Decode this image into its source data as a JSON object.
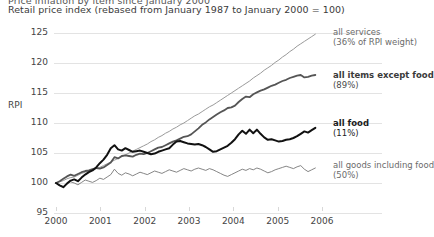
{
  "header": {
    "clipped_title": "Price inflation by item since January 2000",
    "subtitle": "Retail price index (rebased from January 1987 to January 2000 = 100)"
  },
  "chart_data": {
    "type": "line",
    "title": "Retail price index (rebased from January 1987 to January 2000 = 100)",
    "xlabel": "",
    "ylabel": "RPI",
    "ylim": [
      95,
      125
    ],
    "xlim": [
      2000,
      2006
    ],
    "grid": true,
    "legend_position": "right-inline",
    "yticks": [
      "125",
      "120",
      "115",
      "110",
      "105",
      "100",
      "95"
    ],
    "ytick_values": [
      125,
      120,
      115,
      110,
      105,
      100,
      95
    ],
    "xticks": [
      "2000",
      "2001",
      "2002",
      "2003",
      "2004",
      "2005",
      "2006"
    ],
    "xtick_values": [
      2000,
      2001,
      2002,
      2003,
      2004,
      2005,
      2006
    ],
    "series": [
      {
        "name": "all services",
        "sublabel": "(36% of RPI weight)",
        "color": "#9a9a9a",
        "width": 1.0,
        "values": [
          100.0,
          100.2,
          100.4,
          100.7,
          100.9,
          101.0,
          101.3,
          101.6,
          101.8,
          102.0,
          102.2,
          102.4,
          102.6,
          102.9,
          103.2,
          103.5,
          103.8,
          104.1,
          104.4,
          104.7,
          105.0,
          105.3,
          105.6,
          105.9,
          106.2,
          106.5,
          106.9,
          107.2,
          107.6,
          107.9,
          108.3,
          108.6,
          109.0,
          109.3,
          109.7,
          110.0,
          110.4,
          110.8,
          111.2,
          111.5,
          111.9,
          112.3,
          112.7,
          113.0,
          113.4,
          113.8,
          114.2,
          114.6,
          115.0,
          115.4,
          115.8,
          116.2,
          116.6,
          117.0,
          117.5,
          117.9,
          118.3,
          118.8,
          119.2,
          119.6,
          120.1,
          120.5,
          121.0,
          121.4,
          121.9,
          122.3,
          122.8,
          123.2,
          123.6,
          124.0,
          124.4,
          124.8
        ]
      },
      {
        "name": "all items except food",
        "sublabel": "(89%)",
        "color": "#555555",
        "width": 1.8,
        "values": [
          100.0,
          100.3,
          100.7,
          101.1,
          101.4,
          101.2,
          101.5,
          101.8,
          102.0,
          102.1,
          102.3,
          102.5,
          102.4,
          102.6,
          103.0,
          103.4,
          104.3,
          104.1,
          104.5,
          104.6,
          104.5,
          104.4,
          104.7,
          104.9,
          104.8,
          105.0,
          105.3,
          105.6,
          105.9,
          106.0,
          106.3,
          106.6,
          106.9,
          107.1,
          107.4,
          107.7,
          107.8,
          108.1,
          108.6,
          109.1,
          109.7,
          110.1,
          110.6,
          111.0,
          111.4,
          111.8,
          112.1,
          112.5,
          112.6,
          112.9,
          113.5,
          114.0,
          114.4,
          114.3,
          114.8,
          115.1,
          115.4,
          115.6,
          115.9,
          116.2,
          116.4,
          116.7,
          117.0,
          117.2,
          117.5,
          117.7,
          117.9,
          118.0,
          117.6,
          117.7,
          117.9,
          118.0
        ]
      },
      {
        "name": "all food",
        "sublabel": "(11%)",
        "color": "#111111",
        "width": 2.0,
        "values": [
          100.0,
          99.6,
          99.3,
          99.9,
          100.4,
          100.6,
          100.3,
          100.9,
          101.4,
          101.8,
          102.1,
          102.6,
          103.3,
          103.9,
          104.7,
          105.8,
          106.3,
          105.6,
          105.4,
          105.8,
          105.5,
          105.2,
          105.3,
          105.4,
          105.2,
          105.0,
          104.8,
          104.9,
          105.2,
          105.4,
          105.6,
          105.8,
          106.4,
          106.9,
          107.0,
          106.8,
          106.6,
          106.5,
          106.4,
          106.5,
          106.3,
          106.0,
          105.6,
          105.2,
          105.3,
          105.6,
          105.9,
          106.2,
          106.7,
          107.3,
          108.1,
          108.7,
          108.2,
          108.9,
          108.3,
          108.9,
          108.2,
          107.6,
          107.2,
          107.3,
          107.1,
          106.9,
          107.0,
          107.2,
          107.3,
          107.5,
          107.8,
          108.2,
          108.6,
          108.4,
          108.8,
          109.2
        ]
      },
      {
        "name": "all goods including food",
        "sublabel": "(50%)",
        "color": "#777777",
        "width": 0.9,
        "values": [
          100.0,
          99.6,
          99.4,
          99.8,
          100.2,
          100.0,
          99.7,
          100.1,
          100.5,
          100.3,
          100.1,
          100.4,
          100.8,
          100.6,
          101.0,
          101.4,
          102.3,
          101.6,
          101.3,
          101.7,
          101.5,
          101.2,
          101.5,
          101.8,
          101.6,
          101.4,
          101.7,
          102.0,
          101.8,
          101.6,
          101.9,
          102.2,
          102.0,
          101.8,
          102.1,
          102.4,
          102.2,
          102.0,
          102.3,
          102.5,
          102.3,
          102.1,
          102.4,
          102.2,
          101.9,
          101.6,
          101.3,
          101.1,
          101.4,
          101.7,
          102.0,
          102.3,
          102.1,
          102.4,
          102.2,
          102.5,
          102.3,
          102.0,
          101.7,
          101.9,
          102.2,
          102.4,
          102.6,
          102.8,
          102.6,
          102.4,
          102.7,
          102.9,
          102.3,
          101.9,
          102.2,
          102.5
        ]
      }
    ]
  },
  "labels": {
    "series1_line1": "all services",
    "series1_line2": "(36% of RPI weight)",
    "series2_line1": "all items except food",
    "series2_line2": "(89%)",
    "series3_line1": "all food",
    "series3_line2": "(11%)",
    "series4_line1": "all goods including food",
    "series4_line2": "(50%)"
  }
}
